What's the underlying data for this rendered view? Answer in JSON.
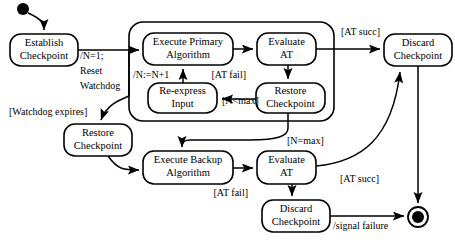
{
  "diagram": {
    "type": "uml-state-machine",
    "canvas": {
      "width": 455,
      "height": 242
    },
    "colors": {
      "stroke": "#000000",
      "fill": "#ffffff",
      "background": "#ffffff"
    }
  },
  "nodes": {
    "start": {
      "label": "",
      "kind": "initial-pseudostate",
      "cx": 23,
      "cy": 9,
      "r": 6
    },
    "establish_checkpoint": {
      "label_line1": "Establish",
      "label_line2": "Checkpoint",
      "x": 10,
      "y": 34,
      "w": 68,
      "h": 32
    },
    "composite_primary": {
      "label": "",
      "x": 129,
      "y": 22,
      "w": 205,
      "h": 99
    },
    "execute_primary": {
      "label_line1": "Execute Primary",
      "label_line2": "Algorithm",
      "x": 143,
      "y": 33,
      "w": 90,
      "h": 32
    },
    "evaluate_at_top": {
      "label_line1": "Evaluate",
      "label_line2": "AT",
      "x": 257,
      "y": 33,
      "w": 59,
      "h": 32
    },
    "re_express_input": {
      "label_line1": "Re-express",
      "label_line2": "Input",
      "x": 148,
      "y": 83,
      "w": 69,
      "h": 30
    },
    "restore_checkpoint_inner": {
      "label_line1": "Restore",
      "label_line2": "Checkpoint",
      "x": 256,
      "y": 83,
      "w": 69,
      "h": 30
    },
    "discard_checkpoint_top": {
      "label_line1": "Discard",
      "label_line2": "Checkpoint",
      "x": 384,
      "y": 34,
      "w": 68,
      "h": 32
    },
    "restore_checkpoint_left": {
      "label_line1": "Restore",
      "label_line2": "Checkpoint",
      "x": 64,
      "y": 124,
      "w": 68,
      "h": 32
    },
    "execute_backup": {
      "label_line1": "Execute Backup",
      "label_line2": "Algorithm",
      "x": 143,
      "y": 151,
      "w": 90,
      "h": 33
    },
    "evaluate_at_bottom": {
      "label_line1": "Evaluate",
      "label_line2": "AT",
      "x": 257,
      "y": 151,
      "w": 59,
      "h": 33
    },
    "discard_checkpoint_bottom": {
      "label_line1": "Discard",
      "label_line2": "Checkpoint",
      "x": 262,
      "y": 200,
      "w": 68,
      "h": 32
    },
    "final": {
      "label": "",
      "kind": "final-state",
      "cx": 418,
      "cy": 217,
      "r_outer": 10,
      "r_inner": 6
    }
  },
  "edge_labels": {
    "reset_watchdog_l1": "/N=1;",
    "reset_watchdog_l2": "Reset",
    "reset_watchdog_l3": "Watchdog",
    "n_increment": "/N:=N+1",
    "watchdog_expires": "[Watchdog expires]",
    "at_fail_top": "[AT fail]",
    "at_succ_top": "[AT succ]",
    "n_less_max": "[N<max]",
    "n_eq_max": "[N=max]",
    "at_succ_bottom": "[AT succ]",
    "at_fail_bottom": "[AT fail]",
    "signal_failure": "/signal failure"
  }
}
